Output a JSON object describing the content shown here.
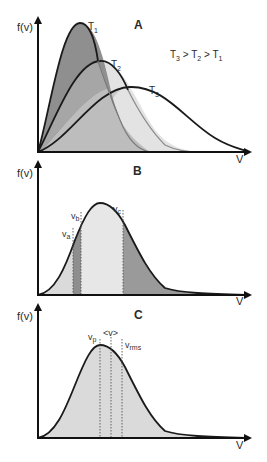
{
  "figure": {
    "colors": {
      "axis": "#111111",
      "curve": "#1a1a1a",
      "fill_dark": "#8e8e8e",
      "fill_mid": "#b5b5b5",
      "fill_light": "#d6d6d6",
      "fill_lighter": "#e6e6e6",
      "dotted": "#555555"
    },
    "panels": [
      {
        "id": "A",
        "letter": "A",
        "y_axis_label": "f(v)",
        "x_axis_label": "V",
        "curves": [
          {
            "name": "T",
            "sub": "1"
          },
          {
            "name": "T",
            "sub": "2"
          },
          {
            "name": "T",
            "sub": "3"
          }
        ],
        "relation": {
          "t3": "T",
          "t3_sub": "3",
          "gt1": " > ",
          "t2": "T",
          "t2_sub": "2",
          "gt2": " > ",
          "t1": "T",
          "t1_sub": "1"
        }
      },
      {
        "id": "B",
        "letter": "B",
        "y_axis_label": "f(v)",
        "x_axis_label": "V",
        "markers": [
          {
            "name": "v",
            "sub": "a"
          },
          {
            "name": "v",
            "sub": "b"
          },
          {
            "name": "v",
            "sub": "c"
          }
        ]
      },
      {
        "id": "C",
        "letter": "C",
        "y_axis_label": "f(v)",
        "x_axis_label": "V",
        "markers": [
          {
            "name": "v",
            "sub": "p"
          },
          {
            "name": "<v>",
            "sub": ""
          },
          {
            "name": "v",
            "sub": "rms"
          }
        ]
      }
    ]
  }
}
